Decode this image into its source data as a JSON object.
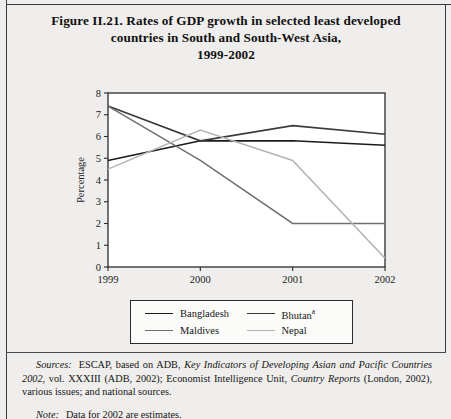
{
  "figure": {
    "title_lines": [
      "Figure II.21.  Rates of GDP growth in selected least developed",
      "countries in South and South-West Asia,",
      "1999-2002"
    ]
  },
  "chart_data": {
    "type": "line",
    "title": "Figure II.21.  Rates of GDP growth in selected least developed countries in South and South-West Asia, 1999-2002",
    "xlabel": "",
    "ylabel": "Percentage",
    "x": [
      "1999",
      "2000",
      "2001",
      "2002"
    ],
    "categories": [
      "1999",
      "2000",
      "2001",
      "2002"
    ],
    "xlim": [
      1999,
      2002
    ],
    "ylim": [
      0,
      8
    ],
    "yticks": [
      0,
      1,
      2,
      3,
      4,
      5,
      6,
      7,
      8
    ],
    "ytick_labels": [
      "0",
      "1",
      "2",
      "3",
      "4",
      "5",
      "6",
      "7",
      "8"
    ],
    "xtick_labels": [
      "1999",
      "2000",
      "2001",
      "2002"
    ],
    "grid": false,
    "legend_position": "below-plot",
    "series": [
      {
        "name": "Bangladesh",
        "color": "#1a1a1a",
        "values": [
          4.9,
          5.8,
          5.8,
          5.6
        ]
      },
      {
        "name": "Bhutan",
        "name_superscript": "a",
        "color": "#3a3a3a",
        "values": [
          7.4,
          5.8,
          6.5,
          6.1
        ]
      },
      {
        "name": "Maldives",
        "color": "#707070",
        "values": [
          7.4,
          4.9,
          2.0,
          2.0
        ]
      },
      {
        "name": "Nepal",
        "color": "#b4b4b4",
        "values": [
          4.5,
          6.3,
          4.9,
          0.4
        ]
      }
    ]
  },
  "legend": {
    "items": [
      {
        "label": "Bangladesh",
        "sup": "",
        "color": "#1a1a1a"
      },
      {
        "label": "Bhutan",
        "sup": "a",
        "color": "#3a3a3a"
      },
      {
        "label": "Maldives",
        "sup": "",
        "color": "#707070"
      },
      {
        "label": "Nepal",
        "sup": "",
        "color": "#b4b4b4"
      }
    ]
  },
  "footnotes": {
    "sources_label": "Sources:",
    "sources_text_1": "ESCAP, based on ADB, ",
    "sources_italic_1": "Key Indicators of Developing Asian and Pacific Countries 2002",
    "sources_text_2": ", vol. XXXIII (ADB, 2002); Economist Intelligence Unit, ",
    "sources_italic_2": "Country Reports",
    "sources_text_3": " (London, 2002), various issues; and national sources.",
    "note_label": "Note:",
    "note_text": "Data for 2002 are estimates."
  }
}
